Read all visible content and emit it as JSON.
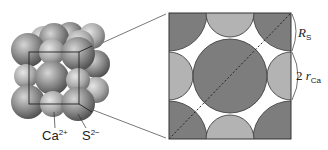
{
  "diagram": {
    "type": "crystal-structure",
    "left_model": {
      "description": "3D ball model of CaS (rock-salt) crystal with unit cube outline",
      "labels": [
        {
          "id": "ca",
          "base": "Ca",
          "sup": "2+"
        },
        {
          "id": "s",
          "base": "S",
          "sup": "2−"
        }
      ]
    },
    "right_section": {
      "description": "Cross-section of face of unit cell with dashed diagonal",
      "labels": {
        "rs": {
          "base": "R",
          "sub": "S"
        },
        "rca": {
          "prefix": "2 ",
          "base": "r",
          "sub": "Ca"
        }
      }
    },
    "colors": {
      "large_ion": "#7d7d7d",
      "small_ion": "#b3b3b3",
      "outline": "#333333",
      "background": "#ffffff"
    }
  }
}
